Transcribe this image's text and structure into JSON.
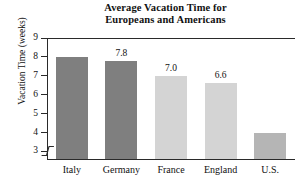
{
  "chart_data": {
    "type": "bar",
    "title": "Average Vacation Time for Europeans and Americans",
    "title_lines": [
      "Average Vacation Time for",
      "Europeans and Americans"
    ],
    "xlabel": "",
    "ylabel": "Vacation Time (weeks)",
    "categories": [
      "Italy",
      "Germany",
      "France",
      "England",
      "U.S."
    ],
    "values": [
      8.0,
      7.8,
      7.0,
      6.6,
      4.0
    ],
    "data_labels": [
      "",
      "7.8",
      "7.0",
      "6.6",
      ""
    ],
    "bar_colors": [
      "#7f7f7f",
      "#7f7f7f",
      "#d4d4d4",
      "#d4d4d4",
      "#b5b5b5"
    ],
    "ylim": [
      2.6,
      9.0
    ],
    "yticks": [
      3,
      4,
      5,
      6,
      7,
      8,
      9
    ],
    "ytick_labels": [
      "3",
      "4",
      "5",
      "6",
      "7",
      "8",
      "9"
    ],
    "grid": false,
    "legend": false,
    "axis_break": true,
    "axis_break_position": "below-3"
  }
}
